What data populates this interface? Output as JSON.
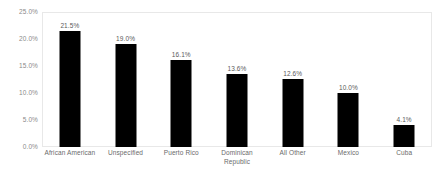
{
  "chart_data": {
    "type": "bar",
    "title": "",
    "subtitle": "",
    "xlabel": "",
    "ylabel": "",
    "ylim": [
      0,
      25
    ],
    "grid": false,
    "legend": false,
    "legend_position": "none",
    "bar_color": "#000000",
    "categories": [
      "African American",
      "Unspecified",
      "Puerto Rico",
      "Dominican Republic",
      "All Other",
      "Mexico",
      "Cuba"
    ],
    "values": [
      21.5,
      19.0,
      16.1,
      13.6,
      12.6,
      10.0,
      4.1
    ],
    "data_labels": [
      "21.5%",
      "19.0%",
      "16.1%",
      "13.6%",
      "12.6%",
      "10.0%",
      "4.1%"
    ],
    "ytick_labels": [
      "25.0%",
      "20.0%",
      "15.0%",
      "10.0%",
      "5.0%",
      "0.0%"
    ],
    "ytick_values": [
      25,
      20,
      15,
      10,
      5,
      0
    ]
  }
}
